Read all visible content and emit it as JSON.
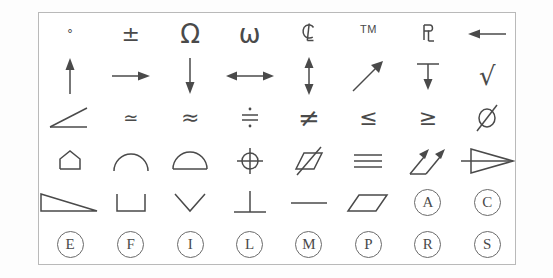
{
  "panel": {
    "title": "Engineering Symbol Palette",
    "rows": 6,
    "columns": 8,
    "border_color": "#b9b9b9",
    "glyph_color": "#4a4a4a",
    "background_color": "#ffffff"
  },
  "symbols": [
    {
      "name": "degree",
      "label": "°",
      "row": 1,
      "col": 1
    },
    {
      "name": "plus-minus",
      "label": "±",
      "row": 1,
      "col": 2
    },
    {
      "name": "omega-capital",
      "label": "Ω",
      "row": 1,
      "col": 3
    },
    {
      "name": "omega-small",
      "label": "ω",
      "row": 1,
      "col": 4
    },
    {
      "name": "centerline",
      "label": "℄",
      "row": 1,
      "col": 5
    },
    {
      "name": "trademark",
      "label": "TM",
      "row": 1,
      "col": 6
    },
    {
      "name": "property-line",
      "label": "PL",
      "row": 1,
      "col": 7
    },
    {
      "name": "arrow-left",
      "label": "←",
      "row": 1,
      "col": 8
    },
    {
      "name": "arrow-up",
      "label": "↑",
      "row": 2,
      "col": 1
    },
    {
      "name": "arrow-right",
      "label": "→",
      "row": 2,
      "col": 2
    },
    {
      "name": "arrow-down",
      "label": "↓",
      "row": 2,
      "col": 3
    },
    {
      "name": "arrow-left-right",
      "label": "↔",
      "row": 2,
      "col": 4
    },
    {
      "name": "arrow-up-down",
      "label": "↕",
      "row": 2,
      "col": 5
    },
    {
      "name": "arrow-diagonal-up-right",
      "label": "↗",
      "row": 2,
      "col": 6
    },
    {
      "name": "depth-arrow-down",
      "label": "↧",
      "row": 2,
      "col": 7
    },
    {
      "name": "radical",
      "label": "√",
      "row": 2,
      "col": 8
    },
    {
      "name": "angle",
      "label": "∠",
      "row": 3,
      "col": 1
    },
    {
      "name": "asymptotically-equal",
      "label": "≃",
      "row": 3,
      "col": 2
    },
    {
      "name": "almost-equal",
      "label": "≈",
      "row": 3,
      "col": 3
    },
    {
      "name": "approximately-equal-dotted",
      "label": "≒",
      "row": 3,
      "col": 4
    },
    {
      "name": "not-equal",
      "label": "≠",
      "row": 3,
      "col": 5
    },
    {
      "name": "less-than-or-equal",
      "label": "≤",
      "row": 3,
      "col": 6
    },
    {
      "name": "greater-than-or-equal",
      "label": "≥",
      "row": 3,
      "col": 7
    },
    {
      "name": "diameter",
      "label": "⌀",
      "row": 3,
      "col": 8
    },
    {
      "name": "conical-taper",
      "label": "⌲",
      "row": 4,
      "col": 1
    },
    {
      "name": "arc",
      "label": "⌒",
      "row": 4,
      "col": 2
    },
    {
      "name": "segment",
      "label": "⌓",
      "row": 4,
      "col": 3
    },
    {
      "name": "true-position",
      "label": "⊕",
      "row": 4,
      "col": 4
    },
    {
      "name": "symmetry-slash",
      "label": "⌱",
      "row": 4,
      "col": 5
    },
    {
      "name": "identical-to",
      "label": "≡",
      "row": 4,
      "col": 6
    },
    {
      "name": "profile-arrows",
      "label": "↗↗",
      "row": 4,
      "col": 7
    },
    {
      "name": "flat-taper",
      "label": "▷",
      "row": 4,
      "col": 8
    },
    {
      "name": "slope",
      "label": "⌲",
      "row": 5,
      "col": 1
    },
    {
      "name": "counterbore",
      "label": "⌴",
      "row": 5,
      "col": 2
    },
    {
      "name": "countersink",
      "label": "⌵",
      "row": 5,
      "col": 3
    },
    {
      "name": "perpendicular",
      "label": "⊥",
      "row": 5,
      "col": 4
    },
    {
      "name": "straightness",
      "label": "—",
      "row": 5,
      "col": 5
    },
    {
      "name": "parallelogram",
      "label": "▱",
      "row": 5,
      "col": 6
    },
    {
      "name": "circled-a",
      "label": "A",
      "row": 5,
      "col": 7
    },
    {
      "name": "circled-c",
      "label": "C",
      "row": 5,
      "col": 8
    },
    {
      "name": "circled-e",
      "label": "E",
      "row": 6,
      "col": 1
    },
    {
      "name": "circled-f",
      "label": "F",
      "row": 6,
      "col": 2
    },
    {
      "name": "circled-i",
      "label": "I",
      "row": 6,
      "col": 3
    },
    {
      "name": "circled-l",
      "label": "L",
      "row": 6,
      "col": 4
    },
    {
      "name": "circled-m",
      "label": "M",
      "row": 6,
      "col": 5
    },
    {
      "name": "circled-p",
      "label": "P",
      "row": 6,
      "col": 6
    },
    {
      "name": "circled-r",
      "label": "R",
      "row": 6,
      "col": 7
    },
    {
      "name": "circled-s",
      "label": "S",
      "row": 6,
      "col": 8
    }
  ]
}
